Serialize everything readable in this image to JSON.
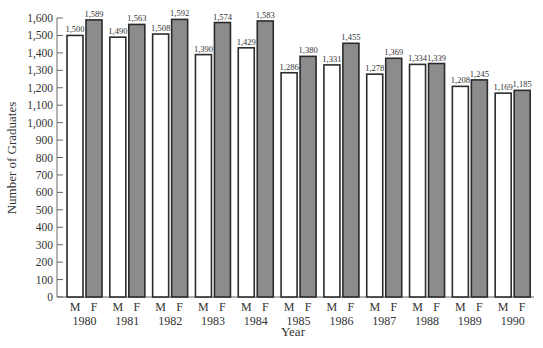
{
  "chart_data": {
    "type": "bar",
    "title": "",
    "xlabel": "Year",
    "ylabel": "Number of Graduates",
    "ylim": [
      0,
      1600
    ],
    "yticks": [
      0,
      100,
      200,
      300,
      400,
      500,
      600,
      700,
      800,
      900,
      1000,
      1100,
      1200,
      1300,
      1400,
      1500,
      1600
    ],
    "ytick_labels": [
      "0",
      "100",
      "200",
      "300",
      "400",
      "500",
      "600",
      "700",
      "800",
      "900",
      "1,000",
      "1,100",
      "1,200",
      "1,300",
      "1,400",
      "1,500",
      "1,600"
    ],
    "categories": [
      "1980",
      "1981",
      "1982",
      "1983",
      "1984",
      "1985",
      "1986",
      "1987",
      "1988",
      "1989",
      "1990"
    ],
    "bar_sublabels": [
      "M",
      "F"
    ],
    "series": [
      {
        "name": "M",
        "color": "#ffffff",
        "values": [
          1500,
          1490,
          1508,
          1390,
          1429,
          1286,
          1331,
          1278,
          1334,
          1208,
          1169
        ],
        "labels": [
          "1,500",
          "1,490",
          "1,508",
          "1,390",
          "1,429",
          "1,286",
          "1,331",
          "1,278",
          "1,334",
          "1,208",
          "1,169"
        ]
      },
      {
        "name": "F",
        "color": "#8c8c8c",
        "values": [
          1589,
          1563,
          1592,
          1574,
          1583,
          1380,
          1455,
          1369,
          1339,
          1245,
          1185
        ],
        "labels": [
          "1,589",
          "1,563",
          "1,592",
          "1,574",
          "1,583",
          "1,380",
          "1,455",
          "1,369",
          "1,339",
          "1,245",
          "1,185"
        ]
      }
    ],
    "grid": false,
    "legend": "none"
  },
  "colors": {
    "male_fill": "#ffffff",
    "female_fill": "#8c8c8c",
    "stroke": "#2b2b2b"
  }
}
